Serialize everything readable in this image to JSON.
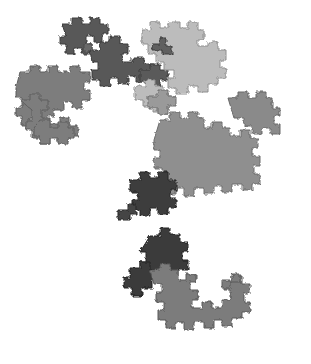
{
  "figure": {
    "background_color": "#ffffff",
    "ghost_text_lines": [
      "",
      "",
      "",
      ""
    ],
    "palette": {
      "dark": "#3a3a3a",
      "dark_mid": "#555555",
      "mid": "#7a7a7a",
      "light_mid": "#8f8f8f",
      "light": "#b9b9b9"
    },
    "clusters": [
      {
        "name": "top-left-dark-dragon",
        "shade": "dark_mid"
      },
      {
        "name": "top-center-dark-dragon",
        "shade": "dark_mid"
      },
      {
        "name": "top-right-light-dragon",
        "shade": "light"
      },
      {
        "name": "left-mid-dragon",
        "shade": "mid"
      },
      {
        "name": "right-mid-dragon",
        "shade": "light_mid"
      },
      {
        "name": "center-dark-dragon",
        "shade": "dark"
      },
      {
        "name": "bottom-dark-dragon",
        "shade": "dark"
      },
      {
        "name": "bottom-mid-dragon",
        "shade": "mid"
      }
    ]
  }
}
